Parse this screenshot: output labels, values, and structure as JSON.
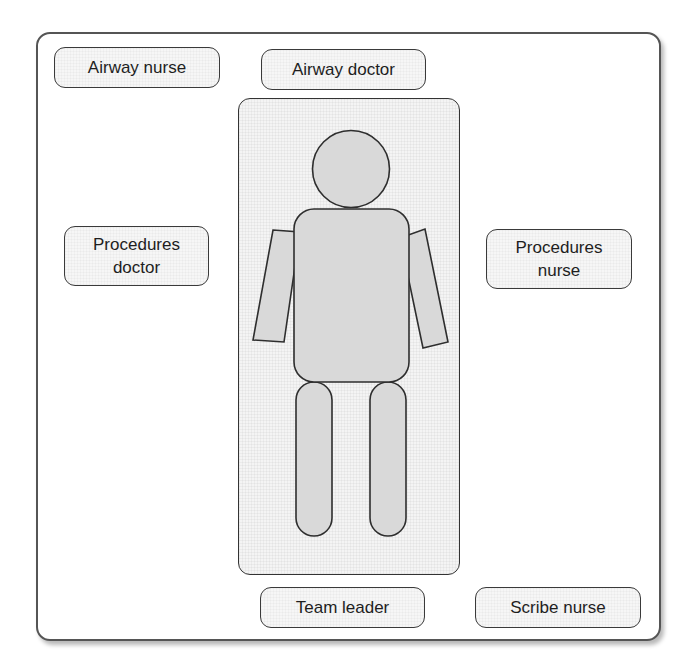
{
  "diagram": {
    "type": "resuscitation team positioning layout",
    "roles": {
      "airway_nurse": "Airway nurse",
      "airway_doctor": "Airway doctor",
      "procedures_doctor": "Procedures\ndoctor",
      "procedures_nurse": "Procedures\nnurse",
      "team_leader": "Team leader",
      "scribe_nurse": "Scribe nurse"
    },
    "patient": {
      "label": "patient on bed",
      "parts": [
        "head",
        "torso",
        "left-arm",
        "right-arm",
        "left-leg",
        "right-leg"
      ]
    },
    "colors": {
      "frame_border": "#555555",
      "box_border": "#3a3a3a",
      "box_fill": "#f6f6f6",
      "bed_fill": "#f4f4f4",
      "body_fill": "#d9d9d9",
      "text": "#1e1e1e"
    }
  }
}
